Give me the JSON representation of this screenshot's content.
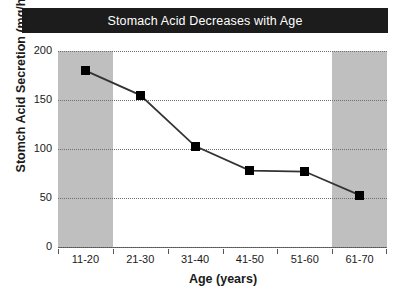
{
  "chart_data": {
    "type": "line",
    "title": "Stomach Acid Decreases with Age",
    "xlabel": "Age (years)",
    "ylabel": "Stomch Acid Secretion (mg/hr)",
    "categories": [
      "11-20",
      "21-30",
      "31-40",
      "41-50",
      "51-60",
      "61-70"
    ],
    "values": [
      180,
      155,
      103,
      78,
      77,
      53
    ],
    "series": [
      {
        "name": "Stomach acid secretion",
        "values": [
          180,
          155,
          103,
          78,
          77,
          53
        ]
      }
    ],
    "ylim": [
      0,
      200
    ],
    "yticks": [
      0,
      50,
      100,
      150,
      200
    ],
    "ytick_labels": [
      "0",
      "50",
      "100",
      "150",
      "200"
    ],
    "grid": true,
    "grid_style": "dotted-horizontal",
    "legend": "none",
    "marker": "square",
    "marker_color": "#000000",
    "line_color": "#333333",
    "shaded_categories": [
      "11-20",
      "61-70"
    ],
    "shade_color": "#bfbfbf",
    "title_background": "#1c1c1c",
    "title_color": "#ffffff",
    "plot_background": "#ffffff"
  }
}
